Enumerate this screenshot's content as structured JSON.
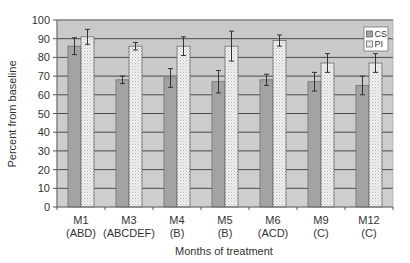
{
  "chart_data": {
    "type": "bar",
    "title": "",
    "xlabel": "Months of treatment",
    "ylabel": "Percent from baseline",
    "ylim": [
      0,
      100
    ],
    "yticks": [
      0,
      10,
      20,
      30,
      40,
      50,
      60,
      70,
      80,
      90,
      100
    ],
    "grid": true,
    "legend_position": "top-right",
    "categories": [
      "M1",
      "M3",
      "M4",
      "M5",
      "M6",
      "M9",
      "M12"
    ],
    "category_sublabels": [
      "(ABD)",
      "(ABCDEF)",
      "(B)",
      "(B)",
      "(ACD)",
      "(C)",
      "(C)"
    ],
    "series": [
      {
        "name": "CS",
        "values": [
          86,
          68,
          69,
          67,
          68,
          67,
          65
        ],
        "errors": [
          4.5,
          2,
          5,
          6,
          3,
          5,
          5
        ],
        "color": "#a3a3a3",
        "pattern": "solid"
      },
      {
        "name": "PI",
        "values": [
          91,
          86,
          86,
          86,
          89,
          77,
          77
        ],
        "errors": [
          4,
          2,
          5,
          8,
          3,
          5,
          5
        ],
        "color": "#efefef",
        "pattern": "dotted"
      }
    ]
  },
  "style": {
    "plot_bg": "#c8c8c8",
    "grid_color": "#4a4a4a",
    "axis_color": "#555555"
  }
}
